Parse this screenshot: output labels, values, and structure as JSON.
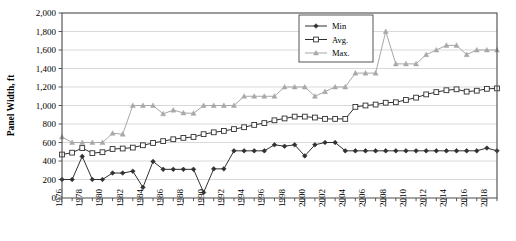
{
  "chart_data": {
    "type": "line",
    "title": "",
    "xlabel": "",
    "ylabel": "Panel Width, ft",
    "ylim": [
      0,
      2000
    ],
    "ytick_step": 200,
    "ytick_labels": [
      "0",
      "200",
      "400",
      "600",
      "800",
      "1,000",
      "1,200",
      "1,400",
      "1,600",
      "1,800",
      "2,000"
    ],
    "xlim": [
      1976,
      2019
    ],
    "xtick_step": 2,
    "xtick_labels": [
      "1976",
      "1978",
      "1980",
      "1982",
      "1984",
      "1986",
      "1988",
      "1990",
      "1992",
      "1994",
      "1996",
      "1998",
      "2000",
      "2002",
      "2004",
      "2006",
      "2008",
      "2010",
      "2012",
      "2014",
      "2016",
      "2018"
    ],
    "grid": true,
    "grid_axis": "y",
    "legend_position": "top-center-right",
    "x": [
      1976,
      1977,
      1978,
      1979,
      1980,
      1981,
      1982,
      1983,
      1984,
      1985,
      1986,
      1987,
      1988,
      1989,
      1990,
      1991,
      1992,
      1993,
      1994,
      1995,
      1996,
      1997,
      1998,
      1999,
      2000,
      2001,
      2002,
      2003,
      2004,
      2005,
      2006,
      2007,
      2008,
      2009,
      2010,
      2011,
      2012,
      2013,
      2014,
      2015,
      2016,
      2017,
      2018,
      2019
    ],
    "series": [
      {
        "name": "Min",
        "marker": "diamond",
        "color": "#303030",
        "values": [
          200,
          200,
          450,
          200,
          200,
          270,
          270,
          290,
          115,
          395,
          310,
          310,
          310,
          310,
          60,
          315,
          315,
          510,
          510,
          510,
          510,
          575,
          560,
          575,
          455,
          575,
          600,
          600,
          510,
          510,
          510,
          510,
          510,
          510,
          510,
          510,
          510,
          510,
          510,
          510,
          510,
          510,
          540,
          510
        ]
      },
      {
        "name": "Avg.",
        "marker": "square-open",
        "color": "#303030",
        "values": [
          470,
          490,
          540,
          485,
          495,
          530,
          535,
          545,
          570,
          595,
          615,
          635,
          650,
          660,
          690,
          710,
          725,
          745,
          765,
          790,
          810,
          840,
          860,
          880,
          880,
          870,
          855,
          855,
          855,
          985,
          1000,
          1010,
          1030,
          1035,
          1060,
          1085,
          1120,
          1145,
          1165,
          1175,
          1150,
          1160,
          1180,
          1185
        ]
      },
      {
        "name": "Max.",
        "marker": "triangle",
        "color": "#a8a8a8",
        "values": [
          660,
          600,
          600,
          600,
          600,
          700,
          690,
          1000,
          1000,
          1000,
          910,
          950,
          920,
          915,
          1000,
          1000,
          1000,
          1000,
          1100,
          1100,
          1100,
          1100,
          1200,
          1200,
          1200,
          1100,
          1150,
          1200,
          1200,
          1350,
          1350,
          1350,
          1800,
          1450,
          1450,
          1450,
          1550,
          1600,
          1650,
          1650,
          1550,
          1600,
          1600,
          1600
        ]
      }
    ]
  },
  "legend": {
    "entries": [
      {
        "label": "Min"
      },
      {
        "label": "Avg."
      },
      {
        "label": "Max."
      }
    ]
  }
}
